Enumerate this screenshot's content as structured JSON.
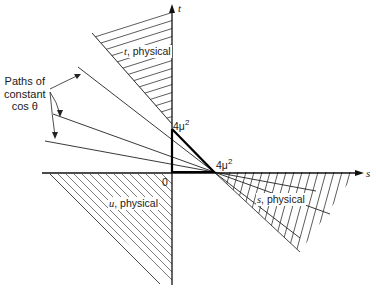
{
  "diagram": {
    "type": "Mandelstam plane (s-t) diagram",
    "axes": {
      "horizontal": {
        "label": "s"
      },
      "vertical": {
        "label": "t"
      },
      "origin_label": "0"
    },
    "thresholds": {
      "t_threshold": {
        "base": "4μ",
        "exp": "2"
      },
      "s_threshold": {
        "base": "4μ",
        "exp": "2"
      }
    },
    "regions": [
      {
        "id": "t-physical",
        "var": "t",
        "text": ", physical"
      },
      {
        "id": "s-physical",
        "var": "s",
        "text": ", physical"
      },
      {
        "id": "u-physical",
        "var": "u",
        "text": ", physical"
      }
    ],
    "annotation": {
      "line1": "Paths of",
      "line2": "constant",
      "line3": "cos θ"
    }
  }
}
